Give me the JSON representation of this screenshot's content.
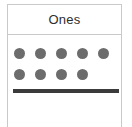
{
  "card": {
    "header": {
      "label": "Ones"
    },
    "counters": {
      "icon": "filled-circle-counter",
      "color": "#6c6c6c",
      "total": 9,
      "rows": [
        {
          "count": 5
        },
        {
          "count": 4
        }
      ]
    },
    "rod": {
      "icon": "horizontal-rod",
      "color": "#3b3b3b"
    },
    "border_color": "#c9c9c9",
    "background_color": "#ffffff"
  }
}
